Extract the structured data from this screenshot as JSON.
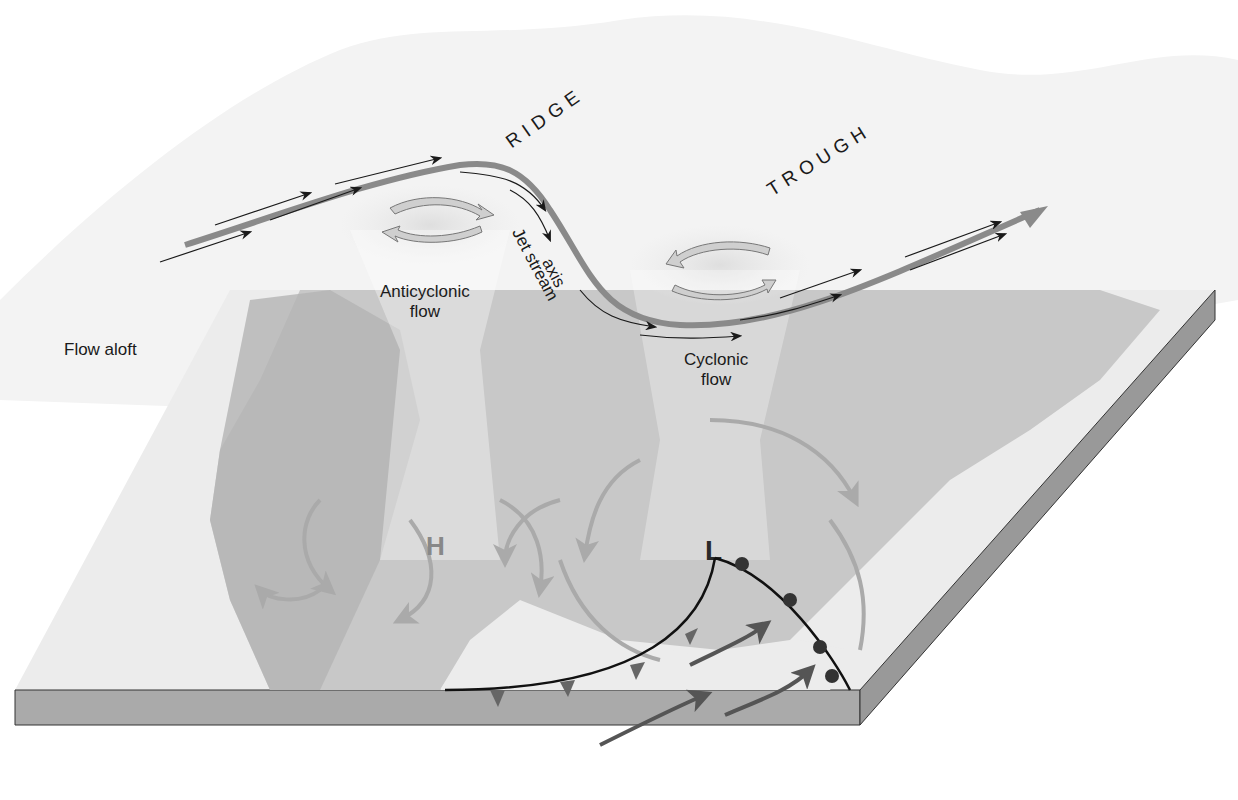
{
  "diagram": {
    "labels": {
      "ridge": "RIDGE",
      "trough": "TROUGH",
      "jet_stream_line1": "Jet stream",
      "jet_stream_line2": "axis",
      "anticyclonic_line1": "Anticyclonic",
      "anticyclonic_line2": "flow",
      "cyclonic_line1": "Cyclonic",
      "cyclonic_line2": "flow",
      "flow_aloft": "Flow aloft",
      "high_pressure": "H",
      "low_pressure": "L"
    },
    "colors": {
      "upper_surface": "#f4f4f4",
      "jet_stream": "#8a8a8a",
      "flow_arrow": "#1a1a1a",
      "land": "#c4c4c4",
      "water": "#ececec",
      "slab_side": "#a8a8a8",
      "front_line": "#111111",
      "front_symbol": "#4a4a4a",
      "surface_arrow": "#aaaaaa",
      "warm_air_arrow": "#555555"
    }
  }
}
